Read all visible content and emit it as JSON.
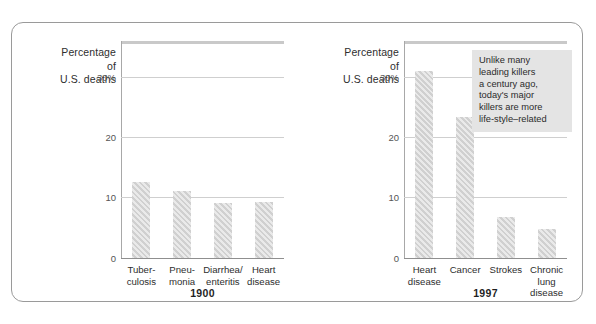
{
  "figure": {
    "background": "#ffffff",
    "border_color": "#9a9a9a",
    "bar_color": "#d0d0d0",
    "grid_color": "#cfcfcf"
  },
  "axis_title": {
    "line1": "Percentage",
    "line2": "of",
    "line3": "U.S. deaths"
  },
  "yticks": [
    {
      "label": "30%",
      "value": 30
    },
    {
      "label": "20",
      "value": 20
    },
    {
      "label": "10",
      "value": 10
    },
    {
      "label": "0",
      "value": 0
    }
  ],
  "panels": [
    {
      "year": "1900"
    },
    {
      "year": "1997"
    }
  ],
  "annotation": {
    "text": "Unlike many\nleading killers\na century ago,\ntoday's major\nkillers are more\nlife-style–related"
  },
  "chart_data": [
    {
      "type": "bar",
      "title": "1900",
      "categories": [
        "Tuber-\nculosis",
        "Pneu-\nmonia",
        "Diarrhea/\nenteritis",
        "Heart\ndisease"
      ],
      "categories_plain": [
        "Tuberculosis",
        "Pneumonia",
        "Diarrhea/enteritis",
        "Heart disease"
      ],
      "values": [
        12.5,
        11.0,
        9.0,
        9.3
      ],
      "xlabel": "1900",
      "ylabel": "Percentage of U.S. deaths",
      "ylim": [
        0,
        36
      ],
      "yticks": [
        0,
        10,
        20,
        30
      ],
      "ytick_labels": [
        "0",
        "10",
        "20",
        "30%"
      ],
      "grid": true,
      "legend": "none"
    },
    {
      "type": "bar",
      "title": "1997",
      "categories": [
        "Heart\ndisease",
        "Cancer",
        "Strokes",
        "Chronic\nlung disease"
      ],
      "categories_plain": [
        "Heart disease",
        "Cancer",
        "Strokes",
        "Chronic lung disease"
      ],
      "values": [
        31.0,
        23.3,
        6.7,
        4.7
      ],
      "xlabel": "1997",
      "ylabel": "Percentage of U.S. deaths",
      "ylim": [
        0,
        36
      ],
      "yticks": [
        0,
        10,
        20,
        30
      ],
      "ytick_labels": [
        "0",
        "10",
        "20",
        "30%"
      ],
      "grid": true,
      "legend": "none",
      "annotations": [
        "Unlike many leading killers a century ago, today's major killers are more life-style–related"
      ]
    }
  ]
}
